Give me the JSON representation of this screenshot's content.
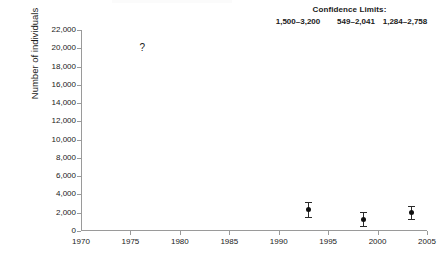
{
  "chart_data": {
    "type": "scatter",
    "title": "",
    "xlabel": "",
    "ylabel": "Number of individuals",
    "xlim": [
      1970,
      2005
    ],
    "ylim": [
      0,
      22000
    ],
    "grid": false,
    "legend_position": "none",
    "x_ticks": [
      1970,
      1975,
      1980,
      1985,
      1990,
      1995,
      2000,
      2005
    ],
    "x_tick_labels": [
      "1970",
      "1975",
      "1980",
      "1985",
      "1990",
      "1995",
      "2000",
      "2005"
    ],
    "y_ticks": [
      0,
      2000,
      4000,
      6000,
      8000,
      10000,
      12000,
      14000,
      16000,
      18000,
      20000,
      22000
    ],
    "y_tick_labels": [
      "0",
      "2,000",
      "4,000",
      "6,000",
      "8,000",
      "10,000",
      "12,000",
      "14,000",
      "16,000",
      "18,000",
      "20,000",
      "22,000"
    ],
    "series": [
      {
        "name": "Population estimate",
        "marker": "filled-circle",
        "points": [
          {
            "x": 1993.0,
            "y": 2350,
            "y_low": 1500,
            "y_high": 3200,
            "ci_label": "1,500–3,200"
          },
          {
            "x": 1998.6,
            "y": 1295,
            "y_low": 549,
            "y_high": 2041,
            "ci_label": "549–2,041"
          },
          {
            "x": 2003.4,
            "y": 2021,
            "y_low": 1284,
            "y_high": 2758,
            "ci_label": "1,284–2,758"
          }
        ]
      }
    ],
    "annotations": [
      {
        "text": "?",
        "x": 1976.2,
        "y": 20000,
        "note": "unknown historical estimate"
      }
    ]
  },
  "header": {
    "confidence_title": "Confidence Limits:",
    "confidence_values": [
      "1,500–3,200",
      "549–2,041",
      "1,284–2,758"
    ]
  },
  "colors": {
    "axis": "#9a9a9a",
    "marker": "#111111",
    "whisker": "#2a2a2a",
    "text": "#1a1a1a",
    "background": "#ffffff"
  }
}
